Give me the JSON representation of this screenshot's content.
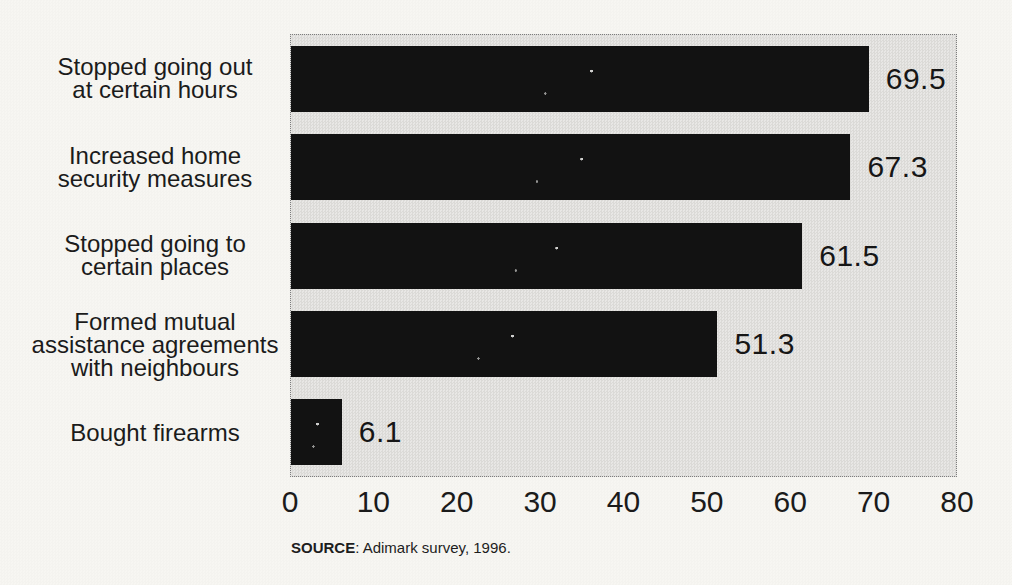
{
  "colors": {
    "page_bg": "#f7f6f2",
    "plot_bg": "#e7e6e3",
    "bar_color": "#121212"
  },
  "chart_data": {
    "type": "bar",
    "orientation": "horizontal",
    "categories": [
      "Stopped going out\nat certain hours",
      "Increased home\nsecurity measures",
      "Stopped going to\ncertain places",
      "Formed mutual\nassistance agreements\nwith neighbours",
      "Bought firearms"
    ],
    "values": [
      69.5,
      67.3,
      61.5,
      51.3,
      6.1
    ],
    "value_labels": [
      "69.5",
      "67.3",
      "61.5",
      "51.3",
      "6.1"
    ],
    "xlim": [
      0,
      80
    ],
    "xticks": [
      "0",
      "10",
      "20",
      "30",
      "40",
      "50",
      "60",
      "70",
      "80"
    ],
    "grid": false,
    "legend": null,
    "title": "",
    "xlabel": "",
    "ylabel": "",
    "source_label": "SOURCE",
    "source_text": ": Adimark survey, 1996."
  }
}
